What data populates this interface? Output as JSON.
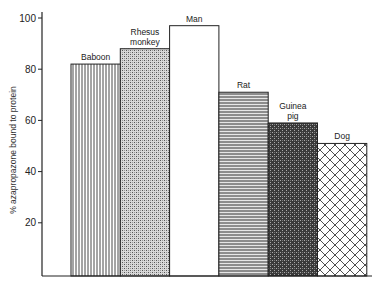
{
  "chart_data": {
    "type": "bar",
    "title": "",
    "xlabel": "",
    "ylabel": "% azapropazone bound to protein",
    "ylim": [
      0,
      100
    ],
    "yticks": [
      20,
      40,
      60,
      80,
      100
    ],
    "grid": false,
    "legend": "none",
    "categories": [
      "Baboon",
      "Rhesus monkey",
      "Man",
      "Rat",
      "Guinea pig",
      "Dog"
    ],
    "label_lines": [
      [
        "Baboon"
      ],
      [
        "Rhesus",
        "monkey"
      ],
      [
        "Man"
      ],
      [
        "Rat"
      ],
      [
        "Guinea",
        "pig"
      ],
      [
        "Dog"
      ]
    ],
    "values": [
      82,
      88,
      97,
      71,
      59,
      51
    ],
    "patterns": [
      "vertical-lines",
      "fine-checker-light",
      "blank",
      "horizontal-lines",
      "dense-checker-dark",
      "diagonal-crosshatch"
    ]
  }
}
